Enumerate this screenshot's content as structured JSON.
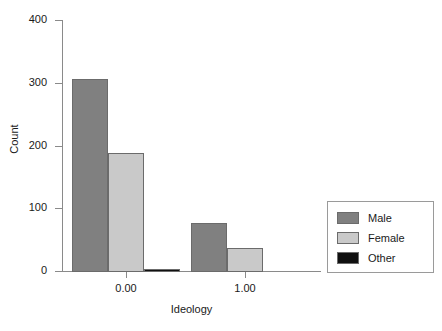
{
  "chart_data": {
    "type": "bar",
    "title": "",
    "subtitle": "",
    "xlabel": "Ideology",
    "ylabel": "Count",
    "categories": [
      "0.00",
      "1.00"
    ],
    "series": [
      {
        "name": "Male",
        "color": "#808080",
        "values": [
          306,
          78
        ]
      },
      {
        "name": "Female",
        "color": "#c9c9c9",
        "values": [
          189,
          38
        ]
      },
      {
        "name": "Other",
        "color": "#101010",
        "values": [
          4,
          0
        ]
      }
    ],
    "ylim": [
      0,
      400
    ],
    "yticks": [
      0,
      100,
      200,
      300,
      400
    ],
    "ytick_labels": [
      "0",
      "100",
      "200",
      "300",
      "400"
    ],
    "xtick_labels": [
      "0.00",
      "1.00"
    ],
    "grid": false,
    "legend_position": "right-bottom",
    "legend_entries": [
      "Male",
      "Female",
      "Other"
    ],
    "bar_mode": "grouped"
  },
  "axes": {
    "y_title": "Count",
    "x_title": "Ideology",
    "y_tick_0": "0",
    "y_tick_1": "100",
    "y_tick_2": "200",
    "y_tick_3": "300",
    "y_tick_4": "400",
    "x_tick_0": "0.00",
    "x_tick_1": "1.00"
  },
  "legend": {
    "items": [
      {
        "label": "Male"
      },
      {
        "label": "Female"
      },
      {
        "label": "Other"
      }
    ]
  },
  "colors": {
    "male": "#808080",
    "female": "#c9c9c9",
    "other": "#101010",
    "axis": "#8a8a8a",
    "text": "#1a1a1a",
    "bar_outline": "#6b6b6b",
    "background": "#ffffff"
  }
}
